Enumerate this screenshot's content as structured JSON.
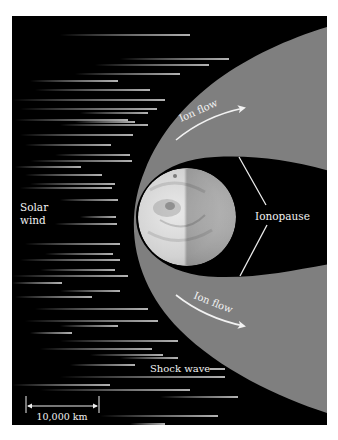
{
  "diagram": {
    "labels": {
      "solar_wind_line1": "Solar",
      "solar_wind_line2": "wind",
      "ion_flow_upper": "Ion flow",
      "ion_flow_lower": "Ion flow",
      "ionopause": "Ionopause",
      "shock_wave": "Shock wave",
      "scale_bar": "10,000 km"
    },
    "colors": {
      "space": "#000000",
      "magnetosheath": "#7f7f7f",
      "label_text": "#f2f2f2",
      "streak": "#e8e8e8",
      "page_background": "#ffffff"
    },
    "panel": {
      "x": 12,
      "y": 16,
      "width": 315,
      "height": 409
    },
    "planet": {
      "cx": 187,
      "cy": 217,
      "r": 49
    },
    "solar_wind_streaks": [
      [
        60,
        190,
        35
      ],
      [
        120,
        229,
        59
      ],
      [
        95,
        209,
        65
      ],
      [
        75,
        180,
        74
      ],
      [
        30,
        118,
        81
      ],
      [
        35,
        150,
        90
      ],
      [
        12,
        165,
        100
      ],
      [
        20,
        157,
        109
      ],
      [
        80,
        148,
        113
      ],
      [
        15,
        128,
        120
      ],
      [
        75,
        135,
        122
      ],
      [
        60,
        148,
        125
      ],
      [
        20,
        133,
        135
      ],
      [
        25,
        111,
        145
      ],
      [
        55,
        130,
        155
      ],
      [
        30,
        132,
        161
      ],
      [
        15,
        81,
        167
      ],
      [
        25,
        102,
        175
      ],
      [
        30,
        115,
        184
      ],
      [
        20,
        112,
        188
      ],
      [
        60,
        118,
        200
      ],
      [
        80,
        116,
        217
      ],
      [
        55,
        117,
        224
      ],
      [
        25,
        120,
        244
      ],
      [
        45,
        113,
        254
      ],
      [
        20,
        120,
        260
      ],
      [
        40,
        115,
        270
      ],
      [
        12,
        128,
        276
      ],
      [
        12,
        62,
        283
      ],
      [
        60,
        120,
        291
      ],
      [
        15,
        92,
        297
      ],
      [
        35,
        148,
        309
      ],
      [
        25,
        158,
        321
      ],
      [
        60,
        118,
        326
      ],
      [
        30,
        72,
        333
      ],
      [
        60,
        178,
        341
      ],
      [
        40,
        152,
        349
      ],
      [
        90,
        163,
        355
      ],
      [
        120,
        178,
        358
      ],
      [
        70,
        135,
        365
      ],
      [
        60,
        225,
        377
      ],
      [
        12,
        110,
        385
      ],
      [
        40,
        190,
        390
      ],
      [
        160,
        238,
        397
      ],
      [
        100,
        218,
        416
      ],
      [
        130,
        165,
        424
      ]
    ]
  }
}
